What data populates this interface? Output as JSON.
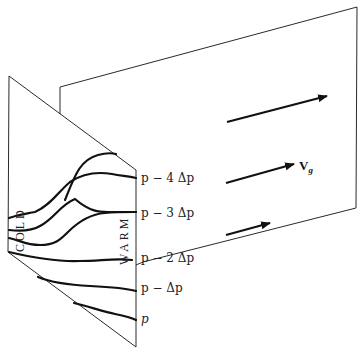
{
  "diagram": {
    "front_plane": {
      "cold_label": "COLD",
      "warm_label": "WARM",
      "pressure_levels": [
        {
          "id": "p4",
          "label": "p − 4 Δp"
        },
        {
          "id": "p3",
          "label": "p − 3 Δp"
        },
        {
          "id": "p2",
          "label": "p − 2 Δp"
        },
        {
          "id": "p1",
          "label": "p − Δp"
        },
        {
          "id": "p0",
          "label": "p"
        }
      ]
    },
    "back_plane": {
      "wind_label_main": "V",
      "wind_label_sub": "g",
      "arrows": [
        {
          "level": "upper",
          "length": "long"
        },
        {
          "level": "middle",
          "length": "medium"
        },
        {
          "level": "lower",
          "length": "short"
        }
      ]
    },
    "colors": {
      "line": "#111111",
      "edge": "#2a2a2a",
      "background": "#ffffff"
    }
  }
}
